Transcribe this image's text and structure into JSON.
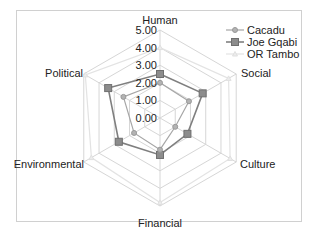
{
  "chart_data": {
    "type": "radar",
    "title": "",
    "categories": [
      "Human",
      "Social",
      "Culture",
      "Financial",
      "Environmental",
      "Political"
    ],
    "series": [
      {
        "name": "Cacadu",
        "values": [
          2.0,
          1.9,
          1.0,
          1.8,
          1.7,
          2.4
        ],
        "color": "#a6a6a6",
        "marker": "circle"
      },
      {
        "name": "Joe Gqabi",
        "values": [
          2.5,
          2.8,
          1.8,
          2.1,
          2.7,
          3.4
        ],
        "color": "#7f7f7f",
        "marker": "square"
      },
      {
        "name": "OR Tambo",
        "values": [
          4.0,
          4.5,
          4.6,
          4.8,
          4.5,
          4.9
        ],
        "color": "#e3e3e3",
        "marker": "triangle"
      }
    ],
    "ticks": [
      "0.00",
      "1.00",
      "2.00",
      "3.00",
      "4.00",
      "5.00"
    ],
    "rlim": [
      0,
      5
    ],
    "grid": true,
    "legend_position": "top-right"
  }
}
